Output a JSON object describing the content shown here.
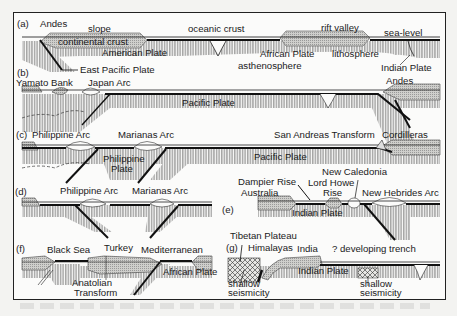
{
  "figure": {
    "panels": [
      {
        "id": "a",
        "tag": "(a)",
        "labels": [
          "Andes",
          "slope",
          "oceanic crust",
          "rift valley",
          "sea-level",
          "continental crust",
          "American Plate",
          "African Plate",
          "lithosphere",
          "asthenosphere",
          "Indian Plate",
          "East Pacific Plate"
        ]
      },
      {
        "id": "b",
        "tag": "(b)",
        "labels": [
          "Yamato Bank",
          "Japan Arc",
          "Pacific Plate",
          "Andes"
        ]
      },
      {
        "id": "c",
        "tag": "(c)",
        "labels": [
          "Philippine Arc",
          "Marianas Arc",
          "Philippine Plate",
          "Pacific Plate",
          "San Andreas Transform",
          "Cordilleras"
        ]
      },
      {
        "id": "d",
        "tag": "(d)",
        "labels": [
          "Philippine Arc",
          "Marianas Arc"
        ]
      },
      {
        "id": "e",
        "tag": "(e)",
        "labels": [
          "Dampier Rise",
          "Australia",
          "Lord Howe Rise",
          "New Caledonia",
          "New Hebrides Arc",
          "Indian Plate"
        ]
      },
      {
        "id": "f",
        "tag": "(f)",
        "labels": [
          "Black Sea",
          "Turkey",
          "Mediterranean",
          "Anatolian Transform",
          "African Plate"
        ]
      },
      {
        "id": "g",
        "tag": "(g)",
        "labels": [
          "Tibetan Plateau",
          "Himalayas",
          "India",
          "? developing trench",
          "Indian Plate",
          "shallow seismicity",
          "shallow seismicity"
        ]
      }
    ],
    "text": {
      "a_tag": "(a)",
      "a_andes": "Andes",
      "a_slope": "slope",
      "a_oceanic": "oceanic crust",
      "a_rift": "rift valley",
      "a_sealevel": "sea-level",
      "a_cont": "continental crust",
      "a_american": "American Plate",
      "a_african": "African Plate",
      "a_litho": "lithosphere",
      "a_astheno": "asthenosphere",
      "a_indian": "Indian Plate",
      "a_eastpac": "East Pacific Plate",
      "b_tag": "(b)",
      "b_yamato": "Yamato Bank",
      "b_japan": "Japan Arc",
      "b_pacific": "Pacific Plate",
      "b_andes": "Andes",
      "c_tag": "(c)",
      "c_phil": "Philippine Arc",
      "c_mar": "Marianas Arc",
      "c_philplate1": "Philippine",
      "c_philplate2": "Plate",
      "c_pacific": "Pacific Plate",
      "c_sanandreas": "San Andreas Transform",
      "c_cord": "Cordilleras",
      "d_tag": "(d)",
      "d_phil": "Philippine Arc",
      "d_mar": "Marianas Arc",
      "e_tag": "(e)",
      "e_dampier": "Dampier Rise",
      "e_australia": "Australia",
      "e_lordhowe1": "Lord Howe",
      "e_lordhowe2": "Rise",
      "e_newcal": "New Caledonia",
      "e_newheb": "New Hebrides Arc",
      "e_indian": "Indian Plate",
      "f_tag": "(f)",
      "f_black": "Black Sea",
      "f_turkey": "Turkey",
      "f_med": "Mediterranean",
      "f_anat1": "Anatolian",
      "f_anat2": "Transform",
      "f_african": "African Plate",
      "g_tag": "(g)",
      "g_tibet": "Tibetan Plateau",
      "g_him": "Himalayas",
      "g_india": "India",
      "g_trench": "? developing trench",
      "g_indian": "Indian Plate",
      "g_shallow1a": "shallow",
      "g_shallow1b": "seismicity",
      "g_shallow2a": "shallow",
      "g_shallow2b": "seismicity"
    }
  }
}
